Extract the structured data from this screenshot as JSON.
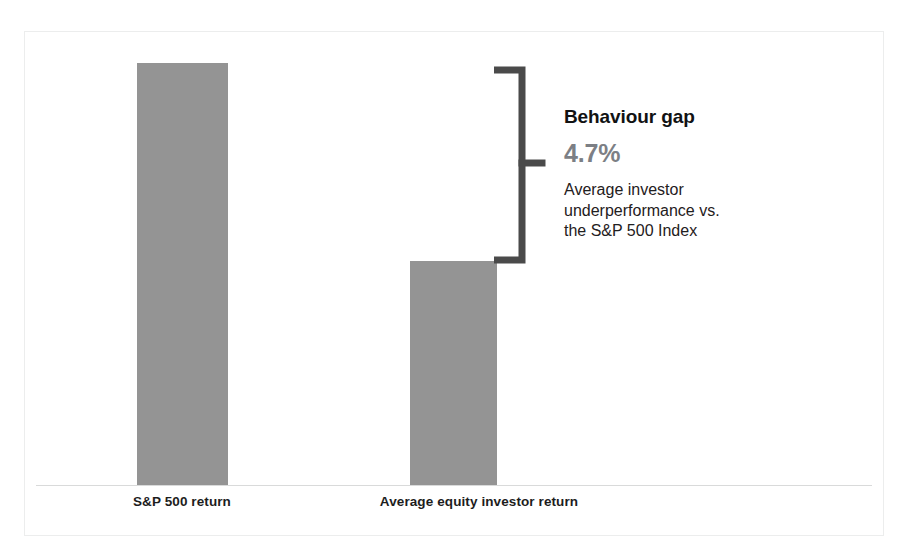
{
  "figure": {
    "background_color": "#ffffff",
    "frame_color": "#eceded",
    "bar_color": "#949494",
    "axis_color": "#d9dada",
    "bracket_color": "#4a4a4a"
  },
  "callout": {
    "title": "Behaviour gap",
    "value": "4.7%",
    "value_color": "#7c7f85",
    "description_lines": [
      "Average investor",
      "underperformance vs.",
      "the S&P 500 Index"
    ]
  },
  "chart_data": {
    "type": "bar",
    "title": "",
    "subtitle": "",
    "xlabel": "",
    "ylabel": "",
    "categories": [
      "S&P 500 return",
      "Average equity investor return"
    ],
    "values": [
      10.0,
      5.3
    ],
    "value_unit": "%",
    "ylim": [
      0,
      10.7
    ],
    "grid": false,
    "legend": null,
    "bar_color": "#949494",
    "annotations": [
      {
        "type": "bracket",
        "label": "Behaviour gap",
        "value": "4.7%",
        "value_numeric": 4.7,
        "description": "Average investor underperformance vs. the S&P 500 Index",
        "spans_from_series": 0,
        "spans_to_series": 1
      }
    ]
  }
}
